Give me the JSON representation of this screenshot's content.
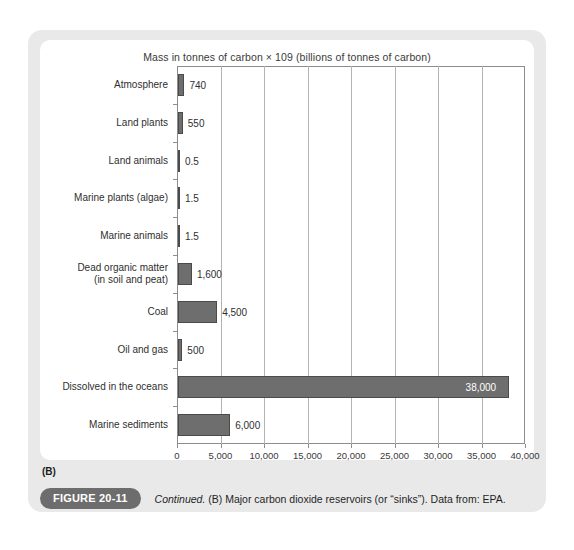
{
  "figure": {
    "panel_letter": "(B)",
    "badge_label": "FIGURE 20-11",
    "caption_italic": "Continued.",
    "caption_rest": "(B) Major carbon dioxide reservoirs (or “sinks”). Data from: EPA."
  },
  "colors": {
    "bar_fill": "#6e6e6e",
    "bar_stroke": "#4a4a4a",
    "gridline": "#b3b3b3",
    "axis": "#8d8d8d",
    "panel_bg": "#e9e9e9",
    "card_bg": "#ffffff",
    "badge_bg": "#6d6d6d"
  },
  "chart_data": {
    "type": "bar",
    "orientation": "horizontal",
    "title": "Mass in tonnes of carbon × 109 (billions of tonnes of carbon)",
    "xlabel": "",
    "ylabel": "",
    "xlim": [
      0,
      40000
    ],
    "grid": true,
    "legend": "none",
    "xticks": [
      0,
      5000,
      10000,
      15000,
      20000,
      25000,
      30000,
      35000,
      40000
    ],
    "xtick_labels": [
      "0",
      "5,000",
      "10,000",
      "15,000",
      "20,000",
      "25,000",
      "30,000",
      "35,000",
      "40,000"
    ],
    "categories": [
      "Atmosphere",
      "Land plants",
      "Land animals",
      "Marine plants (algae)",
      "Marine animals",
      "Dead organic matter\n(in soil and peat)",
      "Coal",
      "Oil and gas",
      "Dissolved in the oceans",
      "Marine sediments"
    ],
    "values": [
      740,
      550,
      0.5,
      1.5,
      1.5,
      1600,
      4500,
      500,
      38000,
      6000
    ],
    "value_labels": [
      "740",
      "550",
      "0.5",
      "1.5",
      "1.5",
      "1,600",
      "4,500",
      "500",
      "38,000",
      "6,000"
    ],
    "label_placement": [
      "outside",
      "outside",
      "outside",
      "outside",
      "outside",
      "outside",
      "outside",
      "outside",
      "inside",
      "outside"
    ]
  }
}
